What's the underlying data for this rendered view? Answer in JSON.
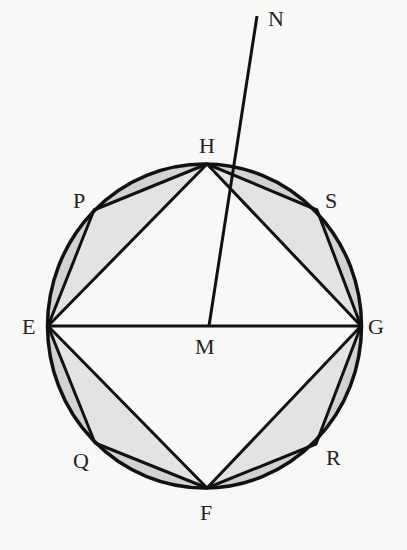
{
  "diagram": {
    "colors": {
      "stroke": "#111111",
      "segment_fill": "#d2d2d2",
      "triangle_fill": "#e3e3e3",
      "background": "#f8f8f6"
    },
    "circle": {
      "center": "M",
      "cx": 204.5,
      "cy": 326,
      "rx": 157,
      "ry": 162
    },
    "points": {
      "E": {
        "label": "E",
        "x": 48,
        "y": 326
      },
      "G": {
        "label": "G",
        "x": 361,
        "y": 326
      },
      "H": {
        "label": "H",
        "x": 207,
        "y": 164
      },
      "F": {
        "label": "F",
        "x": 207,
        "y": 488
      },
      "P": {
        "label": "P",
        "x": 94,
        "y": 210
      },
      "S": {
        "label": "S",
        "x": 317,
        "y": 210
      },
      "Q": {
        "label": "Q",
        "x": 95,
        "y": 443
      },
      "R": {
        "label": "R",
        "x": 316,
        "y": 444
      },
      "M": {
        "label": "M",
        "x": 209,
        "y": 326
      },
      "N": {
        "label": "N",
        "x": 257,
        "y": 16
      }
    },
    "square": [
      "E",
      "H",
      "G",
      "F"
    ],
    "octagon": [
      "E",
      "P",
      "H",
      "S",
      "G",
      "R",
      "F",
      "Q"
    ],
    "segments": [
      [
        "E",
        "G"
      ],
      [
        "M",
        "N"
      ]
    ]
  }
}
